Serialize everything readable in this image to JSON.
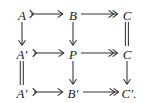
{
  "diagram": {
    "kind": "commutative-diagram",
    "background_color": "#ffffff",
    "ink_color": "#333333",
    "text_color": "#1a1a1a",
    "grid": {
      "rows": 3,
      "cols": 3
    },
    "nodes": [
      {
        "id": "n00",
        "label": "A",
        "row": 0,
        "col": 0,
        "x": 22,
        "y": 15
      },
      {
        "id": "n01",
        "label": "B",
        "row": 0,
        "col": 1,
        "x": 73,
        "y": 15
      },
      {
        "id": "n02",
        "label": "C",
        "row": 0,
        "col": 2,
        "x": 127,
        "y": 15
      },
      {
        "id": "n10",
        "label": "A′",
        "row": 1,
        "col": 0,
        "x": 22,
        "y": 54
      },
      {
        "id": "n11",
        "label": "P",
        "row": 1,
        "col": 1,
        "x": 73,
        "y": 54
      },
      {
        "id": "n12",
        "label": "C",
        "row": 1,
        "col": 2,
        "x": 127,
        "y": 54
      },
      {
        "id": "n20",
        "label": "A′",
        "row": 2,
        "col": 0,
        "x": 22,
        "y": 93
      },
      {
        "id": "n21",
        "label": "B′",
        "row": 2,
        "col": 1,
        "x": 73,
        "y": 93
      },
      {
        "id": "n22",
        "label": "C′.",
        "row": 2,
        "col": 2,
        "x": 129,
        "y": 93
      }
    ],
    "edges": [
      {
        "id": "e-A-B",
        "from": "A",
        "to": "B",
        "type": "monomorphism",
        "glyph": "↣",
        "direction": "right",
        "row": 0
      },
      {
        "id": "e-B-C",
        "from": "B",
        "to": "C",
        "type": "epimorphism",
        "glyph": "↠",
        "direction": "right",
        "row": 0
      },
      {
        "id": "e-Ap-P",
        "from": "A′",
        "to": "P",
        "type": "monomorphism",
        "glyph": "↣",
        "direction": "right",
        "row": 1
      },
      {
        "id": "e-P-C",
        "from": "P",
        "to": "C",
        "type": "epimorphism",
        "glyph": "↠",
        "direction": "right",
        "row": 1
      },
      {
        "id": "e-Ap-Bp",
        "from": "A′",
        "to": "B′",
        "type": "monomorphism",
        "glyph": "↣",
        "direction": "right",
        "row": 2
      },
      {
        "id": "e-Bp-Cp",
        "from": "B′",
        "to": "C′",
        "type": "epimorphism",
        "glyph": "↠",
        "direction": "right",
        "row": 2
      },
      {
        "id": "e-A-Ap",
        "from": "A",
        "to": "A′",
        "type": "arrow",
        "glyph": "↓",
        "direction": "down",
        "col": 0
      },
      {
        "id": "e-Ap-Ap",
        "from": "A′",
        "to": "A′",
        "type": "equality",
        "glyph": "=",
        "direction": "down",
        "col": 0
      },
      {
        "id": "e-B-P",
        "from": "B",
        "to": "P",
        "type": "arrow",
        "glyph": "↓",
        "direction": "down",
        "col": 1
      },
      {
        "id": "e-P-Bp",
        "from": "P",
        "to": "B′",
        "type": "arrow",
        "glyph": "↓",
        "direction": "down",
        "col": 1
      },
      {
        "id": "e-C-C",
        "from": "C",
        "to": "C",
        "type": "equality",
        "glyph": "=",
        "direction": "down",
        "col": 2
      },
      {
        "id": "e-C-Cp",
        "from": "C",
        "to": "C′",
        "type": "arrow",
        "glyph": "↓",
        "direction": "down",
        "col": 2
      }
    ]
  }
}
